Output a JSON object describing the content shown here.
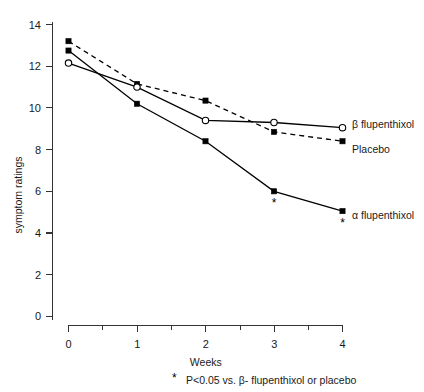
{
  "chart_data": {
    "type": "line",
    "title": "",
    "xlabel": "Weeks",
    "ylabel": "symptom ratings",
    "x": [
      0,
      1,
      2,
      3,
      4
    ],
    "xlim": [
      0,
      4
    ],
    "ylim": [
      0,
      14
    ],
    "xticks": [
      0,
      1,
      2,
      3,
      4
    ],
    "xtick_labels": [
      "0",
      "1",
      "2",
      "3",
      "4"
    ],
    "xticks_minor": [
      0.5,
      1.5,
      2.5,
      3.5
    ],
    "yticks": [
      0,
      2,
      4,
      6,
      8,
      10,
      12,
      14
    ],
    "ytick_labels": [
      "0",
      "2",
      "4",
      "6",
      "8",
      "10",
      "12",
      "14"
    ],
    "grid": false,
    "legend_position": "right-inline",
    "series": [
      {
        "name": "β flupenthixol",
        "marker": "open-circle",
        "line_style": "solid",
        "values": [
          12.15,
          11.0,
          9.4,
          9.3,
          9.05
        ]
      },
      {
        "name": "Placebo",
        "marker": "filled-square",
        "line_style": "dashed",
        "values": [
          13.2,
          11.15,
          10.35,
          8.85,
          8.4
        ]
      },
      {
        "name": "α flupenthixol",
        "marker": "filled-square",
        "line_style": "solid",
        "values": [
          12.75,
          10.2,
          8.4,
          6.0,
          5.05
        ]
      }
    ],
    "annotations": [
      {
        "label": "*",
        "x": 3,
        "y": 6.0,
        "series": "α flupenthixol"
      },
      {
        "label": "*",
        "x": 4,
        "y": 5.05,
        "series": "α flupenthixol"
      }
    ],
    "footnote": "P<0.05 vs. β- flupenthixol or placebo",
    "footnote_marker": "*"
  },
  "legend": {
    "items": [
      {
        "label": "β flupenthixol"
      },
      {
        "label": "Placebo"
      },
      {
        "label": "α flupenthixol"
      }
    ]
  },
  "axes": {
    "x_title": "Weeks",
    "y_title": "symptom ratings",
    "x_tick_labels": [
      "0",
      "1",
      "2",
      "3",
      "4"
    ],
    "y_tick_labels": [
      "0",
      "2",
      "4",
      "6",
      "8",
      "10",
      "12",
      "14"
    ]
  },
  "colors": {
    "ink": "#000000",
    "axis": "#333333",
    "background": "#ffffff"
  }
}
